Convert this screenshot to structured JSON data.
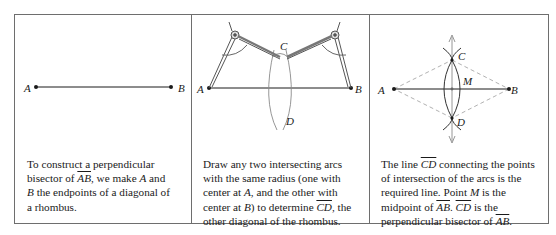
{
  "figure": {
    "panels": [
      {
        "id": "step-1",
        "caption_parts": [
          "To construct a perpendicular",
          "bisector of ",
          "AB",
          ",  we make ",
          "A",
          " and",
          "B",
          " the endpoints of a diagonal of",
          "a rhombus."
        ],
        "labels": {
          "a": "A",
          "b": "B"
        }
      },
      {
        "id": "step-2",
        "caption_parts": [
          "Draw any two intersecting arcs",
          "with the same radius (one with",
          "center at ",
          "A",
          ", and the other with",
          "center at ",
          "B",
          ") to determine ",
          "CD",
          ", the",
          "other diagonal of the rhombus."
        ],
        "labels": {
          "a": "A",
          "b": "B",
          "c": "C",
          "d": "D"
        }
      },
      {
        "id": "step-3",
        "caption_parts": [
          "The line ",
          "CD",
          " connecting the points",
          "of intersection of the arcs is the",
          "required line. Point ",
          "M",
          " is the",
          "midpoint of ",
          "AB",
          ". ",
          "CD",
          " is the",
          "perpendicular bisector of ",
          "AB",
          "."
        ],
        "labels": {
          "a": "A",
          "b": "B",
          "c": "C",
          "d": "D",
          "m": "M"
        }
      }
    ],
    "colors": {
      "border": "#6e6e6e",
      "ink": "#1a1a1a",
      "arc": "#8a8a8a",
      "dashed": "#a8a8a8"
    }
  }
}
